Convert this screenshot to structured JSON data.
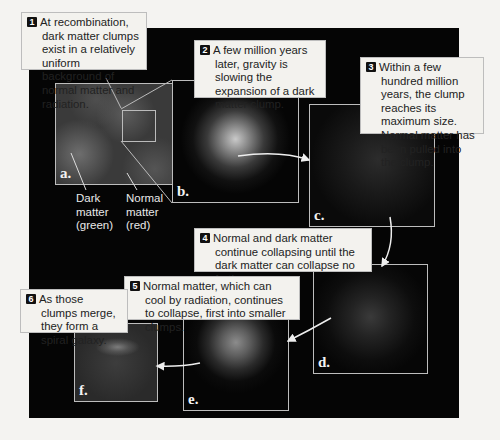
{
  "top_caption": "...empty space of a clump of cold dark matter.",
  "steps": [
    {
      "num": "1",
      "text": "At recombination, dark matter clumps exist in a relatively uniform background of normal matter and radiation."
    },
    {
      "num": "2",
      "text": "A few million years later, gravity is slowing the expansion of a dark matter clump."
    },
    {
      "num": "3",
      "text": "Within a few hundred million years, the clump reaches its maximum size. Normal matter has been pulled into the clump."
    },
    {
      "num": "4",
      "text": "Normal and dark matter continue collapsing until the dark matter can collapse no further."
    },
    {
      "num": "5",
      "text": "Normal matter, which can cool by radiation, continues to collapse, first into smaller clumps."
    },
    {
      "num": "6",
      "text": "As those clumps merge, they form a spiral galaxy."
    }
  ],
  "panels": [
    {
      "label": "a."
    },
    {
      "label": "b."
    },
    {
      "label": "c."
    },
    {
      "label": "d."
    },
    {
      "label": "e."
    },
    {
      "label": "f."
    }
  ],
  "legend": {
    "dark_matter": [
      "Dark",
      "matter",
      "(green)"
    ],
    "normal_matter": [
      "Normal",
      "matter",
      "(red)"
    ]
  }
}
